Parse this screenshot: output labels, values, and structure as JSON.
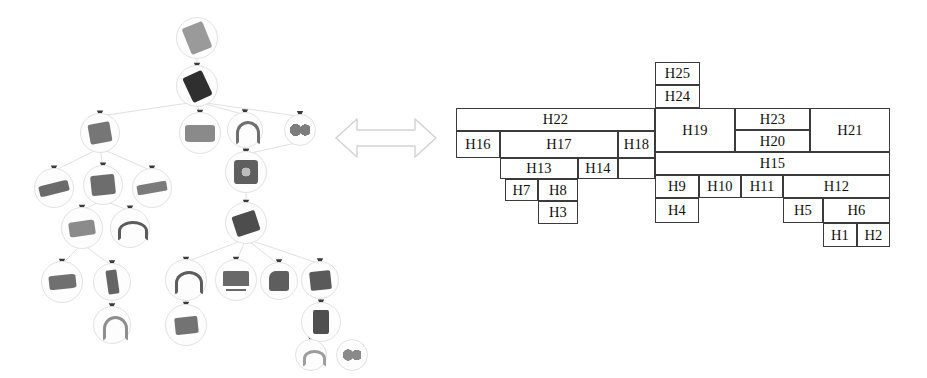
{
  "figure": {
    "relation_icon": "double-headed-arrow-icon",
    "left_panel_title": "object hierarchy tree",
    "right_panel_title": "H-block adjacency layout"
  },
  "tree": {
    "nodes": [
      {
        "id": "t1",
        "cx": 197,
        "cy": 38,
        "r": 21,
        "shape": "slab",
        "w": 22,
        "h": 28,
        "rot": -22,
        "tone": "#9a9a9a"
      },
      {
        "id": "t2",
        "cx": 197,
        "cy": 86,
        "r": 21,
        "shape": "slab",
        "w": 21,
        "h": 27,
        "rot": -25,
        "tone": "#2f2f2f"
      },
      {
        "id": "t3",
        "cx": 100,
        "cy": 133,
        "r": 20,
        "shape": "box",
        "w": 22,
        "h": 20,
        "rot": -10,
        "tone": "#767676"
      },
      {
        "id": "t4",
        "cx": 200,
        "cy": 133,
        "r": 21,
        "shape": "wide",
        "w": 30,
        "h": 17,
        "rot": 0,
        "tone": "#8a8a8a"
      },
      {
        "id": "t5",
        "cx": 245,
        "cy": 130,
        "r": 18,
        "shape": "hook",
        "w": 18,
        "h": 18,
        "rot": 0,
        "tone": "#6f6f6f"
      },
      {
        "id": "t6",
        "cx": 300,
        "cy": 130,
        "r": 16,
        "shape": "pair",
        "w": 20,
        "h": 12,
        "rot": 0,
        "tone": "#7d7d7d"
      },
      {
        "id": "t7",
        "cx": 54,
        "cy": 188,
        "r": 20,
        "shape": "bar",
        "w": 30,
        "h": 11,
        "rot": -14,
        "tone": "#6b6b6b"
      },
      {
        "id": "t8",
        "cx": 103,
        "cy": 185,
        "r": 20,
        "shape": "box",
        "w": 24,
        "h": 20,
        "rot": -6,
        "tone": "#6d6d6d"
      },
      {
        "id": "t9",
        "cx": 152,
        "cy": 188,
        "r": 20,
        "shape": "bar",
        "w": 30,
        "h": 10,
        "rot": -10,
        "tone": "#7b7b7b"
      },
      {
        "id": "t10",
        "cx": 246,
        "cy": 172,
        "r": 21,
        "shape": "fan",
        "w": 24,
        "h": 24,
        "rot": 0,
        "tone": "#5f5f5f"
      },
      {
        "id": "t11",
        "cx": 246,
        "cy": 223,
        "r": 21,
        "shape": "slab",
        "w": 24,
        "h": 21,
        "rot": -18,
        "tone": "#4d4d4d"
      },
      {
        "id": "t12",
        "cx": 82,
        "cy": 228,
        "r": 21,
        "shape": "wide",
        "w": 26,
        "h": 15,
        "rot": -8,
        "tone": "#8b8b8b"
      },
      {
        "id": "t13",
        "cx": 130,
        "cy": 228,
        "r": 20,
        "shape": "hook",
        "w": 24,
        "h": 14,
        "rot": 0,
        "tone": "#5b5b5b"
      },
      {
        "id": "t14",
        "cx": 62,
        "cy": 282,
        "r": 21,
        "shape": "wide",
        "w": 27,
        "h": 14,
        "rot": -6,
        "tone": "#707070"
      },
      {
        "id": "t15",
        "cx": 112,
        "cy": 282,
        "r": 19,
        "shape": "tall",
        "w": 11,
        "h": 24,
        "rot": -8,
        "tone": "#656565"
      },
      {
        "id": "t16",
        "cx": 112,
        "cy": 325,
        "r": 19,
        "shape": "hook",
        "w": 19,
        "h": 19,
        "rot": 0,
        "tone": "#8e8e8e"
      },
      {
        "id": "t17",
        "cx": 186,
        "cy": 280,
        "r": 21,
        "shape": "hook",
        "w": 22,
        "h": 18,
        "rot": 0,
        "tone": "#5d5d5d"
      },
      {
        "id": "t18",
        "cx": 186,
        "cy": 325,
        "r": 21,
        "shape": "box",
        "w": 23,
        "h": 17,
        "rot": -6,
        "tone": "#737373"
      },
      {
        "id": "t19",
        "cx": 236,
        "cy": 280,
        "r": 21,
        "shape": "table",
        "w": 26,
        "h": 18,
        "rot": 0,
        "tone": "#696969"
      },
      {
        "id": "t20",
        "cx": 279,
        "cy": 281,
        "r": 19,
        "shape": "chair",
        "w": 20,
        "h": 20,
        "rot": 0,
        "tone": "#5e5e5e"
      },
      {
        "id": "t21",
        "cx": 320,
        "cy": 280,
        "r": 19,
        "shape": "box",
        "w": 21,
        "h": 19,
        "rot": -6,
        "tone": "#5a5a5a"
      },
      {
        "id": "t22",
        "cx": 321,
        "cy": 322,
        "r": 20,
        "shape": "tall",
        "w": 16,
        "h": 24,
        "rot": 0,
        "tone": "#4f4f4f"
      },
      {
        "id": "t23",
        "cx": 311,
        "cy": 355,
        "r": 16,
        "shape": "ring",
        "w": 17,
        "h": 11,
        "rot": 0,
        "tone": "#9d9d9d"
      },
      {
        "id": "t24",
        "cx": 352,
        "cy": 355,
        "r": 16,
        "shape": "pair",
        "w": 18,
        "h": 14,
        "rot": 0,
        "tone": "#8a8a8a"
      }
    ],
    "edges": [
      [
        "t1",
        "t2"
      ],
      [
        "t2",
        "t3"
      ],
      [
        "t2",
        "t4"
      ],
      [
        "t2",
        "t5"
      ],
      [
        "t2",
        "t6"
      ],
      [
        "t3",
        "t7"
      ],
      [
        "t3",
        "t8"
      ],
      [
        "t3",
        "t9"
      ],
      [
        "t5",
        "t10"
      ],
      [
        "t6",
        "t10"
      ],
      [
        "t10",
        "t11"
      ],
      [
        "t8",
        "t12"
      ],
      [
        "t8",
        "t13"
      ],
      [
        "t12",
        "t14"
      ],
      [
        "t12",
        "t15"
      ],
      [
        "t15",
        "t16"
      ],
      [
        "t11",
        "t17"
      ],
      [
        "t11",
        "t19"
      ],
      [
        "t11",
        "t20"
      ],
      [
        "t11",
        "t21"
      ],
      [
        "t17",
        "t18"
      ],
      [
        "t21",
        "t22"
      ],
      [
        "t22",
        "t23"
      ],
      [
        "t22",
        "t24"
      ]
    ]
  },
  "layout": {
    "cells": [
      {
        "label": "H25",
        "x": 655,
        "y": 62,
        "w": 45,
        "h": 23
      },
      {
        "label": "H24",
        "x": 655,
        "y": 85,
        "w": 45,
        "h": 23
      },
      {
        "label": "H22",
        "x": 456,
        "y": 108,
        "w": 199,
        "h": 23
      },
      {
        "label": "H16",
        "x": 456,
        "y": 131,
        "w": 44,
        "h": 27
      },
      {
        "label": "H17",
        "x": 500,
        "y": 131,
        "w": 118,
        "h": 27
      },
      {
        "label": "H18",
        "x": 618,
        "y": 131,
        "w": 37,
        "h": 27
      },
      {
        "label": "H19",
        "x": 655,
        "y": 108,
        "w": 80,
        "h": 44
      },
      {
        "label": "H23",
        "x": 735,
        "y": 108,
        "w": 75,
        "h": 22
      },
      {
        "label": "H20",
        "x": 735,
        "y": 130,
        "w": 75,
        "h": 22
      },
      {
        "label": "H21",
        "x": 810,
        "y": 108,
        "w": 80,
        "h": 44
      },
      {
        "label": "H13",
        "x": 500,
        "y": 158,
        "w": 78,
        "h": 21
      },
      {
        "label": "H14",
        "x": 578,
        "y": 158,
        "w": 40,
        "h": 21
      },
      {
        "label": "",
        "x": 618,
        "y": 158,
        "w": 37,
        "h": 21
      },
      {
        "label": "H15",
        "x": 655,
        "y": 152,
        "w": 235,
        "h": 23
      },
      {
        "label": "H7",
        "x": 505,
        "y": 179,
        "w": 33,
        "h": 22
      },
      {
        "label": "H8",
        "x": 538,
        "y": 179,
        "w": 40,
        "h": 22
      },
      {
        "label": "H3",
        "x": 538,
        "y": 201,
        "w": 40,
        "h": 23
      },
      {
        "label": "H9",
        "x": 655,
        "y": 175,
        "w": 44,
        "h": 23
      },
      {
        "label": "H10",
        "x": 699,
        "y": 175,
        "w": 42,
        "h": 23
      },
      {
        "label": "H11",
        "x": 741,
        "y": 175,
        "w": 42,
        "h": 23
      },
      {
        "label": "H12",
        "x": 783,
        "y": 175,
        "w": 107,
        "h": 23
      },
      {
        "label": "H4",
        "x": 655,
        "y": 198,
        "w": 44,
        "h": 25
      },
      {
        "label": "H5",
        "x": 783,
        "y": 198,
        "w": 40,
        "h": 25
      },
      {
        "label": "H6",
        "x": 823,
        "y": 198,
        "w": 67,
        "h": 25
      },
      {
        "label": "H1",
        "x": 823,
        "y": 223,
        "w": 34,
        "h": 24
      },
      {
        "label": "H2",
        "x": 857,
        "y": 223,
        "w": 33,
        "h": 24
      }
    ]
  }
}
